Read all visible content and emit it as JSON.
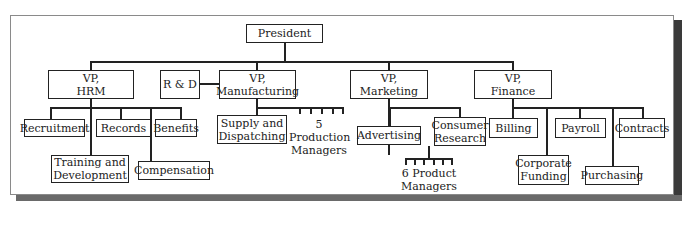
{
  "chart": {
    "type": "organizational-chart",
    "root": "President",
    "vps": [
      {
        "label": "VP,\nHRM",
        "units": [
          "Recruitment",
          "Records",
          "Benefits",
          "Training and\nDevelopment",
          "Compensation"
        ]
      },
      {
        "label": "VP,\nManufacturing",
        "staff": "R & D",
        "units": [
          "Supply and\nDispatching"
        ],
        "group": "5 Production\nManagers",
        "group_count": 5
      },
      {
        "label": "VP,\nMarketing",
        "units": [
          "Advertising",
          "Consumer\nResearch"
        ],
        "group": "6 Product\nManagers",
        "group_count": 6
      },
      {
        "label": "VP,\nFinance",
        "units": [
          "Billing",
          "Payroll",
          "Contracts",
          "Corporate\nFunding",
          "Purchasing"
        ]
      }
    ]
  },
  "nodes": {
    "president": "President",
    "vp_hrm": "VP,\nHRM",
    "rd": "R & D",
    "vp_mfg": "VP,\nManufacturing",
    "vp_mkt": "VP,\nMarketing",
    "vp_fin": "VP,\nFinance",
    "recruitment": "Recruitment",
    "records": "Records",
    "benefits": "Benefits",
    "training": "Training and\nDevelopment",
    "compensation": "Compensation",
    "supply": "Supply and\nDispatching",
    "production_mgrs": "5 Production\nManagers",
    "advertising": "Advertising",
    "consumer_research": "Consumer\nResearch",
    "product_mgrs": "6 Product\nManagers",
    "billing": "Billing",
    "payroll": "Payroll",
    "contracts": "Contracts",
    "corp_funding": "Corporate\nFunding",
    "purchasing": "Purchasing"
  }
}
